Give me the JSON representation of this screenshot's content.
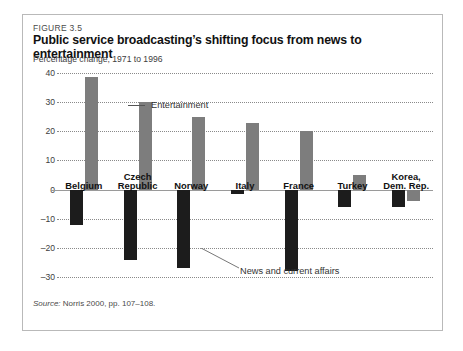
{
  "figure": {
    "number": "FIGURE 3.5",
    "title": "Public service broadcasting’s shifting focus from news to entertainment",
    "subtitle": "Percentage change, 1971 to 1996",
    "source_label": "Source:",
    "source_text": " Norris 2000, pp. 107–108."
  },
  "colors": {
    "news_bar": "#1c1c1c",
    "entertainment_bar": "#7d7d7d",
    "frame_border": "#b9b9b9",
    "gridline": "#8a8a8a",
    "zero_axis": "#9a9a9a",
    "background": "#ffffff"
  },
  "annotations": {
    "entertainment": "Entertainment",
    "news": "News and current affairs"
  },
  "chart_data": {
    "type": "bar",
    "title": "Public service broadcasting’s shifting focus from news to entertainment",
    "subtitle": "Percentage change, 1971 to 1996",
    "xlabel": "",
    "ylabel": "Percentage change, 1971 to 1996",
    "ylim": [
      -33,
      41
    ],
    "yticks": [
      40,
      30,
      20,
      10,
      0,
      -10,
      -20,
      -30
    ],
    "ytick_labels": [
      "40",
      "30",
      "20",
      "10",
      "0",
      "–10",
      "–20",
      "–30"
    ],
    "grid": true,
    "legend": "annotations",
    "categories": [
      "Belgium",
      "Czech\nRepublic",
      "Norway",
      "Italy",
      "France",
      "Turkey",
      "Korea,\nDem. Rep."
    ],
    "series": [
      {
        "name": "News and current affairs",
        "color": "#1c1c1c",
        "values": [
          -12,
          -24,
          -27,
          -1.5,
          -28,
          -6,
          -6
        ]
      },
      {
        "name": "Entertainment",
        "color": "#7d7d7d",
        "values": [
          38.5,
          30,
          25,
          23,
          20,
          5,
          -4
        ]
      }
    ]
  }
}
